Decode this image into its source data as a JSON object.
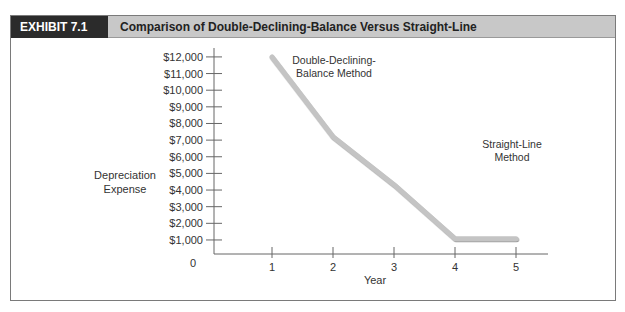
{
  "exhibit": {
    "label": "EXHIBIT 7.1",
    "title": "Comparison of Double-Declining-Balance Versus Straight-Line"
  },
  "colors": {
    "header_dark": "#2b2b2b",
    "header_light": "#c8c8c8",
    "ddb_line": "#c4c4c4",
    "sl_line": "#8a8a8a",
    "axis": "#666666"
  },
  "chart_data": {
    "type": "line",
    "title": "Comparison of Double-Declining-Balance Versus Straight-Line",
    "xlabel": "Year",
    "ylabel": "Depreciation Expense",
    "x": [
      1,
      2,
      3,
      4,
      5
    ],
    "x_tick_labels": [
      "1",
      "2",
      "3",
      "4",
      "5"
    ],
    "y_tick_labels": [
      "0",
      "$1,000",
      "$2,000",
      "$3,000",
      "$4,000",
      "$5,000",
      "$6,000",
      "$7,000",
      "$8,000",
      "$9,000",
      "$10,000",
      "$11,000",
      "$12,000"
    ],
    "ylim": [
      0,
      12000
    ],
    "grid": false,
    "series": [
      {
        "name": "Double-Declining-Balance Method",
        "values": [
          12000,
          7200,
          4320,
          1080,
          1080
        ]
      },
      {
        "name": "Straight-Line Method",
        "values": [
          5400,
          5400,
          5400,
          5400,
          5400
        ]
      }
    ],
    "annotations": [
      {
        "text": "Double-Declining-",
        "line2": "Balance Method"
      },
      {
        "text": "Straight-Line",
        "line2": "Method"
      }
    ],
    "legend_position": "inline annotations"
  }
}
